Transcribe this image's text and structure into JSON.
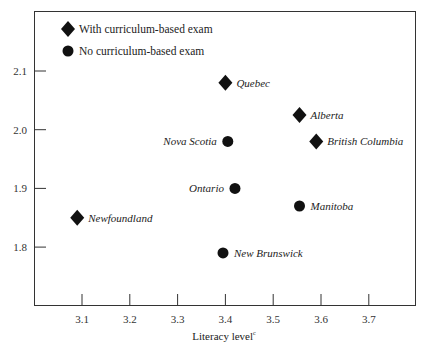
{
  "chart_data": {
    "type": "scatter",
    "title": "",
    "xlabel": "Literacy level",
    "xlabel_superscript": "c",
    "ylabel": "",
    "xlim": [
      3.0,
      3.79
    ],
    "ylim": [
      1.7,
      2.2
    ],
    "x_ticks": [
      3.1,
      3.2,
      3.3,
      3.4,
      3.5,
      3.6,
      3.7
    ],
    "x_tick_labels": [
      "3.1",
      "3.2",
      "3.3",
      "3.4",
      "3.5",
      "3.6",
      "3.7"
    ],
    "y_ticks": [
      2.1,
      2.0,
      1.9,
      1.8
    ],
    "y_tick_labels": [
      "2.1",
      "2.0",
      "1.9",
      "1.8"
    ],
    "grid": false,
    "legend_position": "top-left",
    "series": [
      {
        "name": "With curriculum-based exam",
        "marker": "diamond",
        "points": [
          {
            "label": "Quebec",
            "x": 3.4,
            "y": 2.08,
            "label_side": "right"
          },
          {
            "label": "Alberta",
            "x": 3.555,
            "y": 2.025,
            "label_side": "right"
          },
          {
            "label": "British Columbia",
            "x": 3.59,
            "y": 1.98,
            "label_side": "right"
          },
          {
            "label": "Newfoundland",
            "x": 3.09,
            "y": 1.85,
            "label_side": "right"
          }
        ]
      },
      {
        "name": "No curriculum-based exam",
        "marker": "circle",
        "points": [
          {
            "label": "Nova Scotia",
            "x": 3.405,
            "y": 1.98,
            "label_side": "left"
          },
          {
            "label": "Ontario",
            "x": 3.42,
            "y": 1.9,
            "label_side": "left"
          },
          {
            "label": "Manitoba",
            "x": 3.555,
            "y": 1.87,
            "label_side": "right"
          },
          {
            "label": "New Brunswick",
            "x": 3.395,
            "y": 1.79,
            "label_side": "right"
          }
        ]
      }
    ]
  },
  "colors": {
    "marker": "#111111",
    "axis": "#333333",
    "background": "#ffffff"
  }
}
